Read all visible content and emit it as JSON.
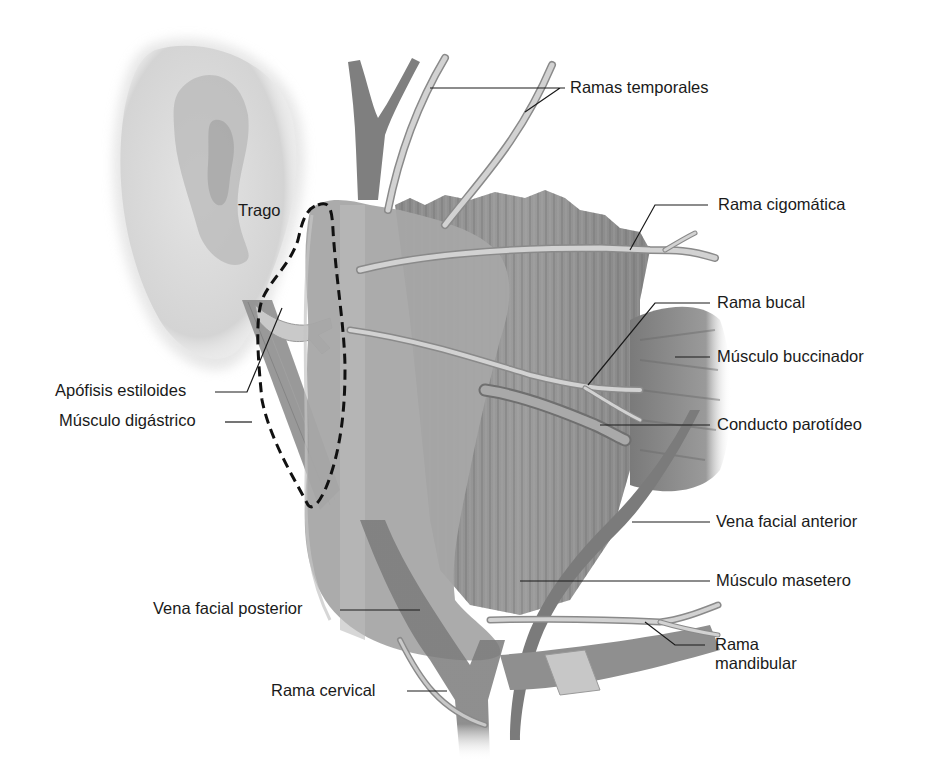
{
  "figure": {
    "colors": {
      "background": "#ffffff",
      "ear": "#d9d9d9",
      "ear_shadow": "#a8a8a8",
      "gland": "#a9a9a9",
      "gland_light": "#bcbcbc",
      "muscle_masseter": "#8c8c8c",
      "muscle_buccinator": "#9a9a9a",
      "vein": "#7d7d7d",
      "nerve": "#cfcfcf",
      "nerve_outline": "#8a8a8a",
      "leader_line": "#1a1a1a",
      "dashed_outline": "#111111"
    }
  },
  "labels": {
    "ramas_temporales": "Ramas temporales",
    "rama_cigomatica": "Rama cigomática",
    "trago": "Trago",
    "rama_bucal": "Rama bucal",
    "musculo_buccinador": "Músculo buccinador",
    "apofisis_estiloides": "Apófisis estiloides",
    "musculo_digastrico": "Músculo digástrico",
    "conducto_parotideo": "Conducto parotídeo",
    "vena_facial_anterior": "Vena facial anterior",
    "musculo_masetero": "Músculo masetero",
    "vena_facial_posterior": "Vena facial posterior",
    "rama_mandibular": "Rama\nmandibular",
    "rama_cervical": "Rama cervical"
  }
}
